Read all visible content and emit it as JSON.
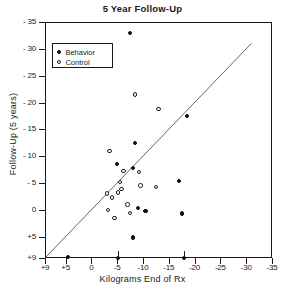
{
  "chart_data": {
    "type": "scatter",
    "title": "5 Year Follow-Up",
    "xlabel": "Kilograms End of Rx",
    "ylabel": "Follow-Up  (5 years)",
    "grid": false,
    "legend_position": "top-left",
    "xlim": [
      9,
      -35
    ],
    "ylim": [
      9,
      -35
    ],
    "xticks": [
      "+9",
      "+5",
      "0",
      "-5",
      "-10",
      "-15",
      "-20",
      "-25",
      "-30",
      "-35"
    ],
    "xtick_values": [
      9,
      5,
      0,
      -5,
      -10,
      -15,
      -20,
      -25,
      -30,
      -35
    ],
    "yticks": [
      "+9",
      "+5",
      "0",
      "- 5",
      "- 10",
      "- 15",
      "- 20",
      "- 25",
      "- 30",
      "- 35"
    ],
    "ytick_values": [
      9,
      5,
      0,
      -5,
      -10,
      -15,
      -20,
      -25,
      -30,
      -35
    ],
    "reference_line": {
      "label": "line of no change",
      "from": [
        9,
        9
      ],
      "to": [
        -31,
        -31
      ]
    },
    "series": [
      {
        "name": "Behavior",
        "marker": "filled-circle",
        "color": "#111111",
        "points": [
          [
            -7.5,
            -33.0
          ],
          [
            -18.5,
            -17.5
          ],
          [
            -8.5,
            -12.5
          ],
          [
            -5.0,
            -8.5
          ],
          [
            -8.0,
            -7.8
          ],
          [
            -17.0,
            -5.3
          ],
          [
            -9.0,
            -0.3
          ],
          [
            -10.5,
            0.2
          ],
          [
            -17.5,
            0.7
          ],
          [
            -8.0,
            5.2
          ],
          [
            4.5,
            8.8
          ],
          [
            -5.2,
            9.0
          ],
          [
            -18.0,
            9.0
          ]
        ]
      },
      {
        "name": "Control",
        "marker": "open-circle",
        "color": "#222222",
        "points": [
          [
            -8.5,
            -21.5
          ],
          [
            -13.0,
            -18.8
          ],
          [
            -3.5,
            -11.0
          ],
          [
            -6.2,
            -7.2
          ],
          [
            -9.2,
            -7.0
          ],
          [
            -5.5,
            -5.2
          ],
          [
            -9.5,
            -4.5
          ],
          [
            -12.5,
            -4.3
          ],
          [
            -5.8,
            -3.8
          ],
          [
            -5.2,
            -3.2
          ],
          [
            -3.0,
            -3.0
          ],
          [
            -4.0,
            -2.3
          ],
          [
            -7.0,
            -1.0
          ],
          [
            -3.2,
            0.1
          ],
          [
            -7.5,
            0.6
          ],
          [
            -4.5,
            1.6
          ]
        ]
      }
    ],
    "off_scale_markers": [
      {
        "x": -5.2,
        "note": "bottom-axis flag"
      },
      {
        "x": -18.0,
        "note": "bottom-axis flag"
      }
    ]
  },
  "legend": {
    "items": [
      {
        "label": "Behavior",
        "marker": "filled-circle"
      },
      {
        "label": "Control",
        "marker": "open-circle"
      }
    ]
  }
}
